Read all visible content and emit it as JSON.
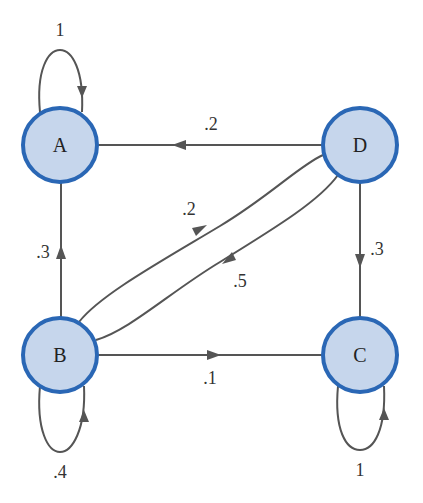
{
  "diagram": {
    "type": "markov-chain-state-diagram",
    "colors": {
      "node_fill": "#c6d6ec",
      "node_stroke": "#2a67b5",
      "edge": "#555555",
      "text": "#222222"
    },
    "nodes": [
      {
        "id": "A",
        "label": "A"
      },
      {
        "id": "B",
        "label": "B"
      },
      {
        "id": "C",
        "label": "C"
      },
      {
        "id": "D",
        "label": "D"
      }
    ],
    "edges": [
      {
        "from": "A",
        "to": "A",
        "label": "1"
      },
      {
        "from": "D",
        "to": "A",
        "label": ".2"
      },
      {
        "from": "B",
        "to": "D",
        "label": ".2"
      },
      {
        "from": "D",
        "to": "B",
        "label": ".5"
      },
      {
        "from": "B",
        "to": "A",
        "label": ".3"
      },
      {
        "from": "D",
        "to": "C",
        "label": ".3"
      },
      {
        "from": "B",
        "to": "C",
        "label": ".1"
      },
      {
        "from": "B",
        "to": "B",
        "label": ".4"
      },
      {
        "from": "C",
        "to": "C",
        "label": "1"
      }
    ]
  }
}
